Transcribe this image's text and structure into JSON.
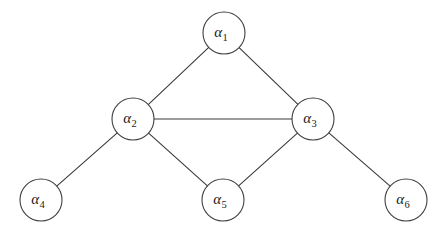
{
  "diagram": {
    "type": "undirected-graph",
    "background_color": "#ffffff",
    "edge_color": "#3a3a3a",
    "node_fill_color": "#ffffff",
    "node_stroke_color": "#3f3f3f",
    "node_radius": 21,
    "nodes": [
      {
        "id": "a1",
        "symbol": "α",
        "subscript": "1",
        "label": "α₁",
        "cx": 224,
        "cy": 33
      },
      {
        "id": "a2",
        "symbol": "α",
        "subscript": "2",
        "label": "α₂",
        "cx": 133,
        "cy": 119
      },
      {
        "id": "a3",
        "symbol": "α",
        "subscript": "3",
        "label": "α₃",
        "cx": 313,
        "cy": 119
      },
      {
        "id": "a4",
        "symbol": "α",
        "subscript": "4",
        "label": "α₄",
        "cx": 41,
        "cy": 200
      },
      {
        "id": "a5",
        "symbol": "α",
        "subscript": "5",
        "label": "α₅",
        "cx": 223,
        "cy": 200
      },
      {
        "id": "a6",
        "symbol": "α",
        "subscript": "6",
        "label": "α₆",
        "cx": 406,
        "cy": 200
      }
    ],
    "edges": [
      {
        "id": "e-a1-a2",
        "from": "a1",
        "to": "a2",
        "label": "α₁—α₂"
      },
      {
        "id": "e-a1-a3",
        "from": "a1",
        "to": "a3",
        "label": "α₁—α₃"
      },
      {
        "id": "e-a2-a3",
        "from": "a2",
        "to": "a3",
        "label": "α₂—α₃"
      },
      {
        "id": "e-a2-a4",
        "from": "a2",
        "to": "a4",
        "label": "α₂—α₄"
      },
      {
        "id": "e-a2-a5",
        "from": "a2",
        "to": "a5",
        "label": "α₂—α₅"
      },
      {
        "id": "e-a3-a5",
        "from": "a3",
        "to": "a5",
        "label": "α₃—α₅"
      },
      {
        "id": "e-a3-a6",
        "from": "a3",
        "to": "a6",
        "label": "α₃—α₆"
      }
    ]
  }
}
